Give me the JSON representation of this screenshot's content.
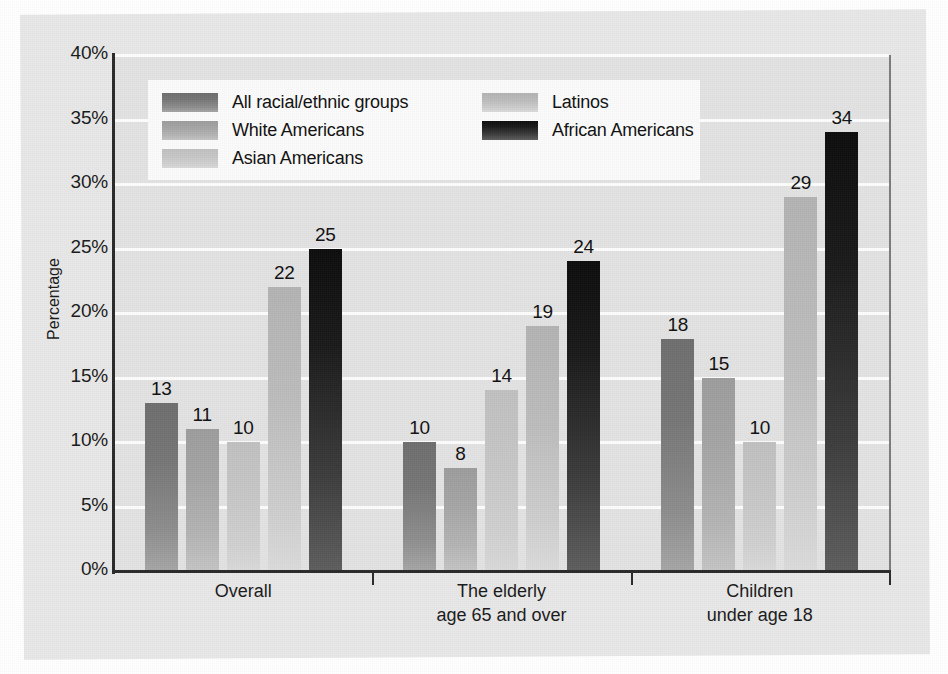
{
  "chart_data": {
    "type": "bar",
    "title": "",
    "xlabel": "",
    "ylabel": "Percentage",
    "ylim": [
      0,
      40
    ],
    "ytick_labels": [
      "0%",
      "5%",
      "10%",
      "15%",
      "20%",
      "25%",
      "30%",
      "35%",
      "40%"
    ],
    "ytick_values": [
      0,
      5,
      10,
      15,
      20,
      25,
      30,
      35,
      40
    ],
    "grid": true,
    "legend_position": "upper-left-inside",
    "categories": [
      "Overall",
      "The elderly age 65 and over",
      "Children under age 18"
    ],
    "category_lines": [
      [
        "Overall",
        ""
      ],
      [
        "The elderly",
        "age 65 and over"
      ],
      [
        "Children",
        "under age 18"
      ]
    ],
    "series": [
      {
        "name": "All racial/ethnic groups",
        "color": "#767676",
        "values": [
          13,
          10,
          18
        ]
      },
      {
        "name": "White Americans",
        "color": "#a5a5a5",
        "values": [
          11,
          8,
          15
        ]
      },
      {
        "name": "Asian Americans",
        "color": "#c6c6c6",
        "values": [
          10,
          14,
          10
        ]
      },
      {
        "name": "Latinos",
        "color": "#bcbcbc",
        "values": [
          22,
          19,
          29
        ]
      },
      {
        "name": "African Americans",
        "color": "#1a1a1a",
        "values": [
          25,
          24,
          34
        ]
      }
    ],
    "value_labels": [
      [
        "13",
        "11",
        "10",
        "22",
        "25"
      ],
      [
        "10",
        "8",
        "14",
        "19",
        "24"
      ],
      [
        "18",
        "15",
        "10",
        "29",
        "34"
      ]
    ]
  }
}
